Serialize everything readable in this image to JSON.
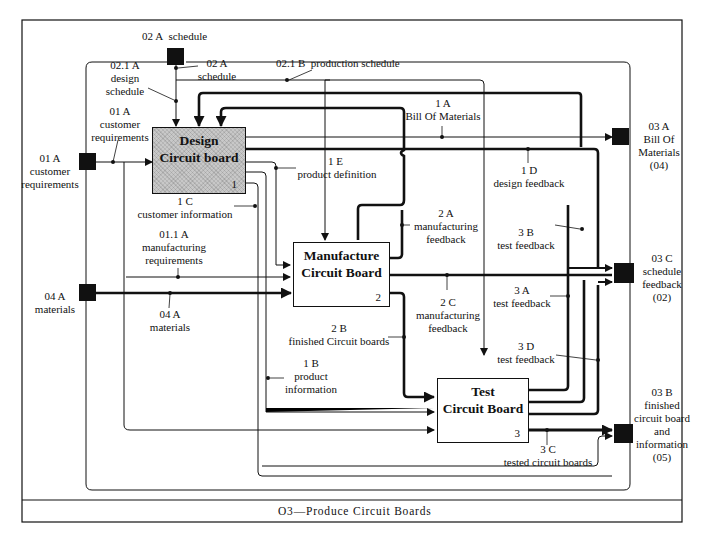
{
  "diagram": {
    "title": "O3—Produce Circuit Boards",
    "type": "IDEF0 activity diagram"
  },
  "activities": [
    {
      "id": "1",
      "title_line1": "Design",
      "title_line2": "Circuit  board",
      "number": "1",
      "shaded": true
    },
    {
      "id": "2",
      "title_line1": "Manufacture",
      "title_line2": "Circuit  Board",
      "number": "2",
      "shaded": false
    },
    {
      "id": "3",
      "title_line1": "Test",
      "title_line2": "Circuit  Board",
      "number": "3",
      "shaded": false
    }
  ],
  "boundary_connectors": {
    "schedule_in": {
      "code": "02 A",
      "name": "schedule"
    },
    "customer_requirements_in": {
      "code": "01 A",
      "name_line1": "customer",
      "name_line2": "requirements"
    },
    "materials_in": {
      "code": "04 A",
      "name": "materials"
    },
    "bom_out": {
      "code": "03 A",
      "name_line1": "Bill Of",
      "name_line2": "Materials",
      "ref": "(04)"
    },
    "schedule_feedback_out": {
      "code": "03 C",
      "name_line1": "schedule",
      "name_line2": "feedback",
      "ref": "(02)"
    },
    "finished_out": {
      "code": "03 B",
      "name_line1": "finished",
      "name_line2": "circuit board",
      "name_line3": "and",
      "name_line4": "information",
      "ref": "(05)"
    }
  },
  "arrows": {
    "a02a": {
      "code": "02 A",
      "name": "schedule"
    },
    "a021a": {
      "code": "02.1 A",
      "name_line1": "design",
      "name_line2": "schedule"
    },
    "a021b": {
      "code": "02.1 B",
      "name": "production schedule"
    },
    "a01a": {
      "code": "01 A",
      "name_line1": "customer",
      "name_line2": "requirements"
    },
    "a011a": {
      "code": "01.1 A",
      "name_line1": "manufacturing",
      "name_line2": "requirements"
    },
    "a04a": {
      "code": "04 A",
      "name": "materials"
    },
    "a1a": {
      "code": "1 A",
      "name": "Bill Of Materials"
    },
    "a1b": {
      "code": "1 B",
      "name_line1": "product",
      "name_line2": "information"
    },
    "a1c": {
      "code": "1 C",
      "name": "customer information"
    },
    "a1d": {
      "code": "1 D",
      "name": "design feedback"
    },
    "a1e": {
      "code": "1 E",
      "name": "product definition"
    },
    "a2a": {
      "code": "2 A",
      "name_line1": "manufacturing",
      "name_line2": "feedback"
    },
    "a2b": {
      "code": "2 B",
      "name": "finished Circuit boards"
    },
    "a2c": {
      "code": "2 C",
      "name_line1": "manufacturing",
      "name_line2": "feedback"
    },
    "a3a": {
      "code": "3 A",
      "name": "test feedback"
    },
    "a3b": {
      "code": "3 B",
      "name": "test feedback"
    },
    "a3c": {
      "code": "3 C",
      "name": "tested circuit boards"
    },
    "a3d": {
      "code": "3 D",
      "name": "test feedback"
    }
  },
  "colors": {
    "ink": "#111111",
    "background": "#ffffff",
    "shade": "#c8c8c8"
  }
}
